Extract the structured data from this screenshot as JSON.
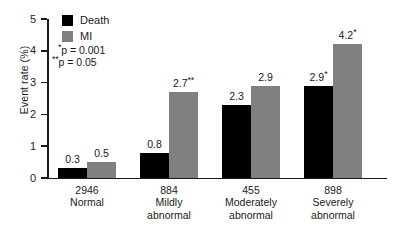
{
  "chart_data": {
    "type": "bar",
    "title": "",
    "xlabel": "",
    "ylabel": "Event rate (%)",
    "ylim": [
      0,
      5
    ],
    "yticks": [
      "0",
      "1",
      "2",
      "3",
      "4",
      "5"
    ],
    "grid": false,
    "legend_position": "top-left",
    "categories": [
      "Normal",
      "Mildly abnormal",
      "Moderately abnormal",
      "Severely abnormal"
    ],
    "category_counts": [
      "2946",
      "884",
      "455",
      "898"
    ],
    "series": [
      {
        "name": "Death",
        "color": "#000000",
        "values": [
          0.3,
          0.8,
          2.3,
          2.9
        ],
        "labels": [
          "0.3",
          "0.8",
          "2.3",
          "2.9"
        ],
        "significance": [
          "",
          "",
          "",
          "*"
        ]
      },
      {
        "name": "MI",
        "color": "#808080",
        "values": [
          0.5,
          2.7,
          2.9,
          4.2
        ],
        "labels": [
          "0.5",
          "2.7",
          "2.9",
          "4.2"
        ],
        "significance": [
          "",
          "**",
          "",
          "*"
        ]
      }
    ],
    "annotations": [
      {
        "stars": "*",
        "text": "p = 0.001"
      },
      {
        "stars": "**",
        "text": "p = 0.05"
      }
    ]
  }
}
